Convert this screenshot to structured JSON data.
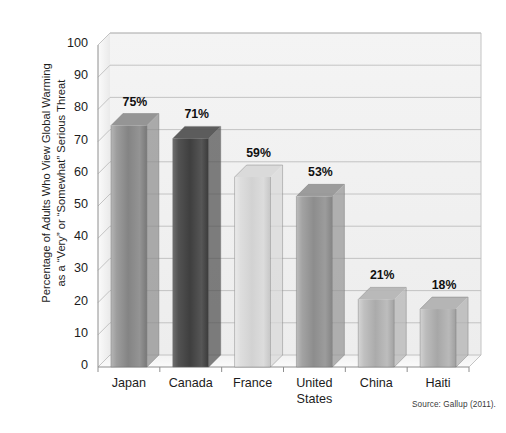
{
  "chart_data": {
    "type": "bar",
    "title": "",
    "subtitle": "",
    "xlabel": "",
    "ylabel": "Percentage of Adults Who View Global Warming\nas a “Very” or “Somewhat” Serious Threat",
    "categories": [
      "Japan",
      "Canada",
      "France",
      "United\nStates",
      "China",
      "Haiti"
    ],
    "values": [
      75,
      71,
      59,
      53,
      21,
      18
    ],
    "data_labels": [
      "75%",
      "71%",
      "59%",
      "53%",
      "21%",
      "18%"
    ],
    "ylim": [
      0,
      100
    ],
    "ytick_step": 10,
    "ytick_labels": [
      "0",
      "10",
      "20",
      "30",
      "40",
      "50",
      "60",
      "70",
      "80",
      "90",
      "100"
    ],
    "grid": true,
    "grid_axis": "y",
    "legend": false,
    "legend_position": "none",
    "style": "3d-column",
    "bar_colors": [
      "#8d8d8d",
      "#4f4f4f",
      "#d8d8d8",
      "#959595",
      "#b4b4b4",
      "#b0b0b0"
    ],
    "annotation": "Source: Gallup (2011).",
    "units": "percent"
  },
  "source": {
    "note": "Source: Gallup (2011)."
  },
  "colors": {
    "background": "#ffffff",
    "plot_wall": "#f0f0f0",
    "grid_line": "#bdbdbd",
    "axis_line": "#8e8e8e",
    "text": "#1c1c1c"
  }
}
